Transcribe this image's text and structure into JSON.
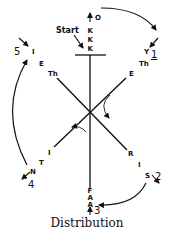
{
  "title": "Distribution",
  "start_label": "Start",
  "top": {
    "arrow_label": "O",
    "letters": [
      "K",
      "K",
      "K"
    ]
  },
  "bottom": {
    "letters": [
      "F",
      "A",
      "A"
    ],
    "arrow_label": "3"
  },
  "upper_left": {
    "number": "5",
    "letters": [
      "I",
      "E",
      "Th"
    ]
  },
  "upper_right": {
    "number": "1",
    "letters": [
      "Y",
      "Th",
      "E"
    ]
  },
  "lower_left": {
    "number": "4",
    "letters": [
      "I",
      "T",
      "N"
    ]
  },
  "lower_right": {
    "number": "2",
    "letters": [
      "R",
      "I",
      "S"
    ]
  },
  "colors": {
    "ink": "#111111",
    "background": "#ffffff"
  }
}
